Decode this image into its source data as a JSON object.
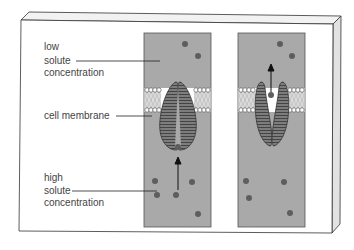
{
  "diagram": {
    "labels": {
      "low": [
        "low",
        "solute",
        "concentration"
      ],
      "membrane": "cell membrane",
      "high": [
        "high",
        "solute",
        "concentration"
      ]
    },
    "colors": {
      "panel_fill": "#a9a9a9",
      "panel_border": "#555555",
      "protein_fill": "#7d7d7d",
      "solute_dot": "#5e5e5e",
      "board_edge": "#e6e6e6",
      "text": "#444444"
    },
    "panels": [
      {
        "name": "closed-open-to-bottom",
        "state": "solute entering channel from high concentration side",
        "arrow": "up-into-channel"
      },
      {
        "name": "open-to-top",
        "state": "solute released to low concentration side",
        "arrow": "up-out-of-channel"
      }
    ]
  }
}
